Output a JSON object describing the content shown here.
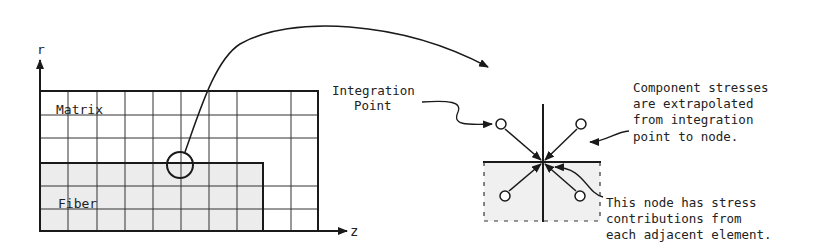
{
  "left_panel": {
    "axis_r": "r",
    "axis_z": "z",
    "matrix_label": "Matrix",
    "fiber_label": "Fiber"
  },
  "right_panel": {
    "integration_label_line1": "Integration",
    "integration_label_line2": "Point",
    "component_note": [
      "Component stresses",
      "are extrapolated",
      "from integration",
      "point to node."
    ],
    "node_note": [
      "This node has stress",
      "contributions from",
      "each adjacent element."
    ]
  },
  "colors": {
    "line": "#1a1a1a",
    "fiber_fill": "#ececec",
    "grid": "#333333"
  }
}
